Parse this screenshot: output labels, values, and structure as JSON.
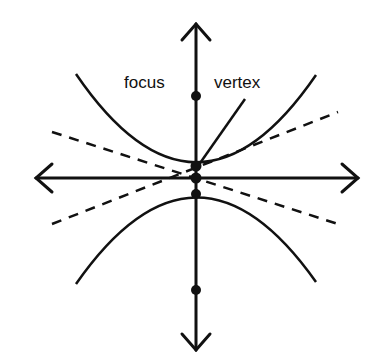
{
  "diagram": {
    "labels": {
      "focus": "focus",
      "vertex": "vertex"
    },
    "colors": {
      "stroke": "#111111",
      "background": "#ffffff"
    },
    "elements": {
      "axes": [
        "x-axis (double arrow)",
        "y-axis (double arrow)"
      ],
      "branches": [
        "upper branch",
        "lower branch"
      ],
      "asymptotes": [
        "dashed asymptote 1",
        "dashed asymptote 2"
      ],
      "points": [
        "upper focus",
        "upper vertex",
        "center",
        "lower vertex",
        "lower focus"
      ]
    }
  }
}
